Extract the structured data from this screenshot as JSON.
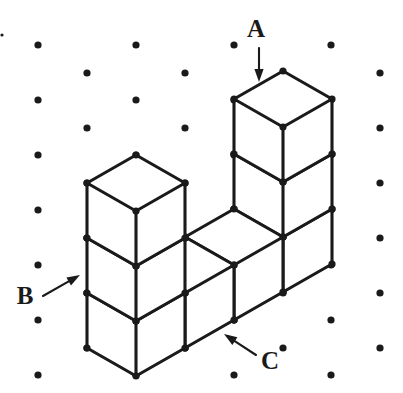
{
  "figure": {
    "background_color": "#ffffff",
    "ink_color": "#1a1a1a",
    "lattice": {
      "dot_radius": 3.6,
      "column_x": [
        38,
        87,
        136,
        185,
        234,
        283,
        331,
        380
      ],
      "row_spacing": 55,
      "even_column_y": [
        45,
        100,
        155,
        210,
        265,
        320,
        375
      ],
      "odd_column_y": [
        73,
        128,
        183,
        238,
        293,
        348
      ],
      "corner_speck": {
        "x": 2,
        "y": 35,
        "r": 1.6
      }
    },
    "isometric": {
      "origin_x": 136,
      "origin_y": 376,
      "half_width": 49,
      "half_depth": 28,
      "cube_height": 55
    },
    "columns": [
      {
        "name": "left-tower",
        "base_u": 0,
        "cubes": 3
      },
      {
        "name": "middle-front",
        "base_u": 1,
        "cubes": 1
      },
      {
        "name": "middle-back",
        "base_u": 2,
        "cubes": 1
      },
      {
        "name": "right-tower",
        "base_u": 3,
        "cubes": 3
      }
    ],
    "pointers": [
      {
        "id": "pointer-a",
        "label": "A",
        "label_x": 256,
        "label_y": 31,
        "tail_x": 259,
        "tail_y": 48,
        "tip_x": 259,
        "tip_y": 82,
        "direction": "down",
        "target": "top face of tall right tower"
      },
      {
        "id": "pointer-b",
        "label": "B",
        "label_x": 25,
        "label_y": 298,
        "tail_x": 43,
        "tail_y": 296,
        "tip_x": 80,
        "tip_y": 275,
        "direction": "up-right",
        "target": "left vertical edge of left tower"
      },
      {
        "id": "pointer-c",
        "label": "C",
        "label_x": 270,
        "label_y": 363,
        "tail_x": 256,
        "tail_y": 355,
        "tip_x": 224,
        "tip_y": 334,
        "direction": "up-left",
        "target": "bottom front-right edge of base row"
      }
    ]
  }
}
